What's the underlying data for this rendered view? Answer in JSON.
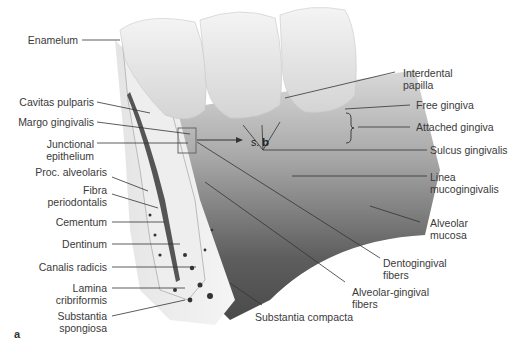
{
  "figure": {
    "panel_letter": "a",
    "crossref": {
      "prefix": "s.",
      "target": "b"
    }
  },
  "labels_left": [
    {
      "id": "enamelum",
      "text": "Enamelum"
    },
    {
      "id": "cavitas-pulparis",
      "text": "Cavitas pulparis"
    },
    {
      "id": "margo-gingivalis",
      "text": "Margo gingivalis"
    },
    {
      "id": "junctional-epithelium",
      "lines": [
        "Junctional",
        "epithelium"
      ]
    },
    {
      "id": "proc-alveolaris",
      "text": "Proc. alveolaris"
    },
    {
      "id": "fibra-periodontalis",
      "lines": [
        "Fibra",
        "periodontalis"
      ]
    },
    {
      "id": "cementum",
      "text": "Cementum"
    },
    {
      "id": "dentinum",
      "text": "Dentinum"
    },
    {
      "id": "canalis-radicis",
      "text": "Canalis radicis"
    },
    {
      "id": "lamina-cribriformis",
      "lines": [
        "Lamina",
        "cribriformis"
      ]
    },
    {
      "id": "substantia-spongiosa",
      "lines": [
        "Substantia",
        "spongiosa"
      ]
    }
  ],
  "labels_right": [
    {
      "id": "interdental-papilla",
      "lines": [
        "Interdental",
        "papilla"
      ]
    },
    {
      "id": "free-gingiva",
      "text": "Free gingiva"
    },
    {
      "id": "attached-gingiva",
      "text": "Attached gingiva"
    },
    {
      "id": "sulcus-gingivalis",
      "text": "Sulcus gingivalis"
    },
    {
      "id": "linea-mucogingivalis",
      "lines": [
        "Linea",
        "mucogingivalis"
      ]
    },
    {
      "id": "alveolar-mucosa",
      "lines": [
        "Alveolar",
        "mucosa"
      ]
    },
    {
      "id": "dentogingival-fibers",
      "lines": [
        "Dentogingival",
        "fibers"
      ]
    },
    {
      "id": "alveolar-gingival-fibers",
      "lines": [
        "Alveolar-gingival",
        "fibers"
      ]
    },
    {
      "id": "substantia-compacta",
      "text": "Substantia compacta"
    }
  ]
}
